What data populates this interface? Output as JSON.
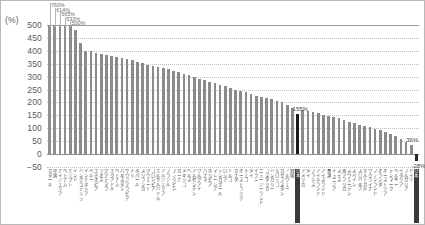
{
  "chart_data": {
    "type": "bar",
    "title": "",
    "xlabel": "",
    "ylabel": "(%)",
    "ylim": [
      -50,
      500
    ],
    "yticks": [
      500,
      450,
      400,
      350,
      300,
      250,
      200,
      150,
      100,
      50,
      0,
      -50
    ],
    "grid": true,
    "legend": null,
    "note": "Bars sorted descending; first four bars exceed the 500% axis cap and carry callout value labels. Japan is highlighted in black.",
    "categories": [
      "カタール",
      "中国",
      "ナイジェリア",
      "ベトナム",
      "エジプト",
      "インド",
      "バングラデシュ",
      "インドネシア",
      "ペルー",
      "エチオピア",
      "ラオス",
      "グアテマラ",
      "エクアドル",
      "ベトナム",
      "パキスタン",
      "サウジアラビア",
      "チリ",
      "ネパール",
      "スリランカ",
      "クウェート",
      "コロンビア",
      "エルサルバドル",
      "アルジェリア",
      "ブラジル",
      "フィリピン",
      "ガーナ",
      "メキシコ",
      "ヘルス",
      "アルゼンチン",
      "ウルグアイ",
      "パナマ",
      "ボリビア",
      "マレーシア",
      "シンガポール",
      "ロシア",
      "トルコ",
      "カナダ",
      "オーストラリア",
      "チェコ",
      "タイ",
      "イラン",
      "ニュージーランド",
      "コスタリカ",
      "ハンガリー",
      "モロッコ",
      "カザフスタン",
      "ノルウェー",
      "韓国",
      "日本",
      "アメリカ",
      "タイ",
      "フランス",
      "アイルランド",
      "アイスランド",
      "香港",
      "チュニジア",
      "スイス",
      "南アフリカ",
      "スウェーデン",
      "スペイン",
      "スロバキア",
      "ポルトガル",
      "ウクライナ",
      "フィンランド",
      "オランダ",
      "オーストリア",
      "デンマーク",
      "ベルギー",
      "イタリア",
      "ブルガリア",
      "ドイツ",
      "日本"
    ],
    "values": [
      760,
      614,
      565,
      533,
      500,
      480,
      432,
      400,
      398,
      392,
      388,
      384,
      380,
      376,
      372,
      368,
      364,
      358,
      352,
      346,
      340,
      336,
      332,
      328,
      322,
      318,
      312,
      306,
      300,
      292,
      286,
      280,
      274,
      268,
      262,
      256,
      250,
      246,
      240,
      232,
      226,
      222,
      216,
      212,
      206,
      200,
      190,
      178,
      155,
      170,
      166,
      162,
      158,
      152,
      148,
      142,
      138,
      132,
      126,
      120,
      114,
      110,
      104,
      98,
      92,
      86,
      78,
      70,
      60,
      48,
      36,
      -28
    ],
    "callouts": [
      {
        "index": 0,
        "label": "760%"
      },
      {
        "index": 1,
        "label": "614%"
      },
      {
        "index": 2,
        "label": "565%"
      },
      {
        "index": 3,
        "label": "533%"
      },
      {
        "index": 4,
        "label": "500%"
      }
    ],
    "point_labels": [
      {
        "index": 48,
        "label": "155%",
        "highlight": true
      },
      {
        "index": 70,
        "label": "36%",
        "highlight": false
      },
      {
        "index": 71,
        "label": "-28%",
        "highlight": true
      }
    ],
    "highlighted_indices": [
      48,
      71
    ]
  },
  "axis": {
    "unit_label": "(%)"
  }
}
